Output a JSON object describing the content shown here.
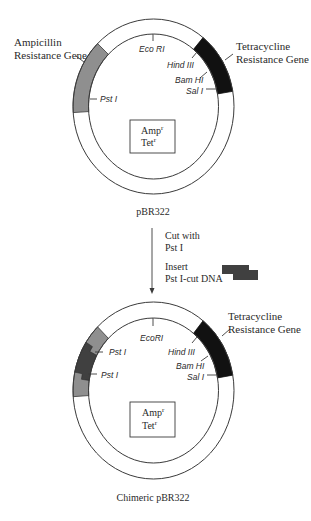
{
  "colors": {
    "ampicillin_gene": "#8f8f8f",
    "tetracycline_gene": "#111111",
    "insert_dna": "#404040",
    "line": "#3a3a3a",
    "text": "#2a2a2a"
  },
  "top_plasmid": {
    "name": "pBR322",
    "amp_label_line1": "Ampicillin",
    "amp_label_line2": "Resistance Gene",
    "tet_label_line1": "Tetracycline",
    "tet_label_line2": "Resistance Gene",
    "sites": {
      "eco_ri": "Eco RI",
      "pst_i": "Pst I",
      "hind_iii": "Hind III",
      "bam_hi": "Bam HI",
      "sal_i": "Sal I"
    },
    "markers": {
      "amp": "Amp",
      "amp_sup": "r",
      "tet": "Tet",
      "tet_sup": "r"
    }
  },
  "procedure": {
    "step1_line1": "Cut with",
    "step1_line2": "Pst I",
    "step2_line1": "Insert",
    "step2_line2": "Pst I-cut DNA"
  },
  "bottom_plasmid": {
    "name": "Chimeric pBR322",
    "tet_label_line1": "Tetracycline",
    "tet_label_line2": "Resistance Gene",
    "sites": {
      "eco_ri": "EcoRI",
      "pst_i_upper": "Pst I",
      "pst_i_lower": "Pst I",
      "hind_iii": "Hind III",
      "bam_hi": "Bam HI",
      "sal_i": "Sal I"
    },
    "markers": {
      "amp": "Amp",
      "amp_sup": "r",
      "tet": "Tet",
      "tet_sup": "r"
    }
  }
}
